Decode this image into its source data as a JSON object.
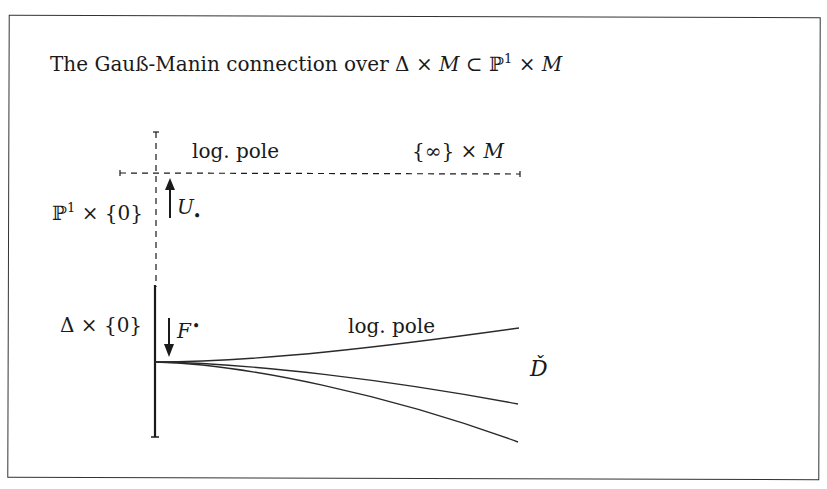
{
  "title_parts": {
    "plain": "The Gauß-Manin connection over ",
    "delta": "Δ",
    "times1": " × ",
    "M1": "M",
    "subset": " ⊂ ",
    "P": "ℙ",
    "sup": "1",
    "times2": " × ",
    "M2": "M"
  },
  "labels": {
    "top_log_pole": "log. pole",
    "infinity_times_M": {
      "brace_open": "{∞} × ",
      "M": "M"
    },
    "p1_times_zero": {
      "P": "ℙ",
      "sup": "1",
      "rest": " × {0}"
    },
    "U_label": {
      "U": "U",
      "dot": "•"
    },
    "delta_times_zero": "Δ × {0}",
    "F_label": {
      "F": "F",
      "dot": "•"
    },
    "lower_log_pole": "log. pole",
    "D_check": "Ď"
  },
  "colors": {
    "ink": "#1a1a1a",
    "border": "#333333",
    "background": "#ffffff"
  }
}
